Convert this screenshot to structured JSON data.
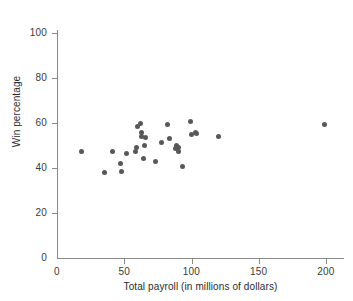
{
  "chart_data": {
    "type": "scatter",
    "title": "",
    "xlabel": "Total payroll (in millions of dollars)",
    "ylabel": "Win percentage",
    "xlim": [
      0,
      208
    ],
    "ylim": [
      0,
      106
    ],
    "xticks": [
      0,
      50,
      100,
      150,
      200
    ],
    "xtick_labels": [
      "0",
      "50",
      "100",
      "150",
      "200"
    ],
    "yticks": [
      0,
      20,
      40,
      60,
      80,
      100
    ],
    "ytick_labels": [
      "0",
      "20",
      "40",
      "60",
      "80",
      "100"
    ],
    "grid": false,
    "legend": "none",
    "marker": {
      "shape": "circle",
      "color": "#585858",
      "size": 5
    },
    "axis_color": "#8a8a8a",
    "points": [
      {
        "x": 18,
        "y": 47.5
      },
      {
        "x": 35,
        "y": 37.8
      },
      {
        "x": 41,
        "y": 47.5
      },
      {
        "x": 47,
        "y": 42.0
      },
      {
        "x": 48,
        "y": 38.6
      },
      {
        "x": 52,
        "y": 46.3
      },
      {
        "x": 58,
        "y": 47.4
      },
      {
        "x": 59,
        "y": 49.0
      },
      {
        "x": 60,
        "y": 58.5
      },
      {
        "x": 62,
        "y": 60.0
      },
      {
        "x": 63,
        "y": 54.0
      },
      {
        "x": 63,
        "y": 55.6
      },
      {
        "x": 64,
        "y": 44.1
      },
      {
        "x": 65,
        "y": 50.0
      },
      {
        "x": 66,
        "y": 53.7
      },
      {
        "x": 73,
        "y": 42.8
      },
      {
        "x": 78,
        "y": 51.2
      },
      {
        "x": 82,
        "y": 59.3
      },
      {
        "x": 84,
        "y": 53.1
      },
      {
        "x": 88,
        "y": 48.5
      },
      {
        "x": 89,
        "y": 50.0
      },
      {
        "x": 90,
        "y": 47.2
      },
      {
        "x": 90,
        "y": 49.0
      },
      {
        "x": 93,
        "y": 40.7
      },
      {
        "x": 99,
        "y": 60.5
      },
      {
        "x": 100,
        "y": 54.9
      },
      {
        "x": 103,
        "y": 55.6
      },
      {
        "x": 104,
        "y": 55.3
      },
      {
        "x": 120,
        "y": 54.0
      },
      {
        "x": 199,
        "y": 59.5
      }
    ]
  }
}
